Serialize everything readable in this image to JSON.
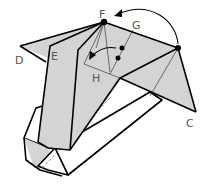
{
  "diagram": {
    "labels": {
      "c": "C",
      "d": "D",
      "e": "E",
      "f": "F",
      "g": "G",
      "h": "H"
    },
    "colors": {
      "shade": "#d4d4d4",
      "line": "#000000",
      "label": "#555555"
    },
    "arrows": [
      {
        "name": "fold-arrow-right-to-f",
        "description": "curved arrow from right corner up to point F"
      },
      {
        "name": "fold-arrow-into-h",
        "description": "curved arrow bringing point inward toward H"
      }
    ],
    "points": [
      {
        "name": "point-f"
      },
      {
        "name": "point-right-corner"
      },
      {
        "name": "reference-dot-upper"
      },
      {
        "name": "reference-dot-lower"
      }
    ]
  }
}
